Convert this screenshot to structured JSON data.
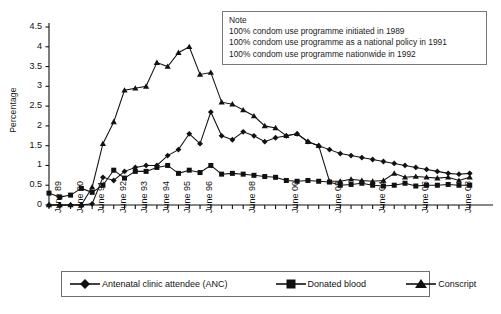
{
  "axis": {
    "y_title": "Percentage",
    "y_ticks": [
      "0",
      "0.5",
      "1",
      "1.5",
      "2",
      "2.5",
      "3",
      "3.5",
      "4",
      "4.5"
    ],
    "x_labels": [
      "June 89",
      "June 90",
      "June 91",
      "June 92",
      "June 93",
      "June 94",
      "June 95",
      "June 96",
      "June 98",
      "June 00",
      "June 02",
      "June 04",
      "June 06",
      "June 08"
    ]
  },
  "note": {
    "title": "Note",
    "line1": "100% condom use programme initiated in 1989",
    "line2": "100% condom use programme as a national policy in 1991",
    "line3": "100% condom use programme nationwide in 1992"
  },
  "legend": {
    "anc": "Antenatal clinic attendee (ANC)",
    "blood": "Donated blood",
    "conscript": "Conscript"
  },
  "chart_data": {
    "type": "line",
    "title": "",
    "xlabel": "",
    "ylabel": "Percentage",
    "ylim": [
      0,
      4.5
    ],
    "ytick_step": 0.5,
    "grid": false,
    "legend_position": "bottom",
    "x": [
      "June 89",
      "Dec 89",
      "June 90",
      "Dec 90",
      "June 91",
      "Dec 91",
      "June 92",
      "Dec 92",
      "June 93",
      "Dec 93",
      "June 94",
      "Dec 94",
      "June 95",
      "Dec 95",
      "June 96",
      "Dec 96",
      "June 97",
      "Dec 97",
      "June 98",
      "Dec 98",
      "June 99",
      "Dec 99",
      "June 00",
      "Dec 00",
      "June 01",
      "Dec 01",
      "June 02",
      "Dec 02",
      "June 03",
      "Dec 03",
      "June 04",
      "Dec 04",
      "June 05",
      "Dec 05",
      "June 06",
      "Dec 06",
      "June 07",
      "Dec 07",
      "June 08",
      "Dec 08"
    ],
    "series": [
      {
        "name": "Antenatal clinic attendee (ANC)",
        "marker": "diamond",
        "values": [
          0,
          0,
          0,
          0,
          0.03,
          0.7,
          0.62,
          0.85,
          0.95,
          1.0,
          1.0,
          1.25,
          1.4,
          1.8,
          1.55,
          2.35,
          1.75,
          1.65,
          1.85,
          1.75,
          1.6,
          1.7,
          1.75,
          1.8,
          1.6,
          1.5,
          1.4,
          1.3,
          1.25,
          1.2,
          1.15,
          1.1,
          1.05,
          1.0,
          0.95,
          0.9,
          0.85,
          0.8,
          0.78,
          0.8
        ]
      },
      {
        "name": "Donated blood",
        "marker": "square",
        "values": [
          0.3,
          0.2,
          0.25,
          0.42,
          0.32,
          0.5,
          0.88,
          0.68,
          0.85,
          0.85,
          0.95,
          1.0,
          0.8,
          0.88,
          0.82,
          1.0,
          0.78,
          0.8,
          0.78,
          0.75,
          0.72,
          0.7,
          0.62,
          0.6,
          0.62,
          0.6,
          0.58,
          0.5,
          0.52,
          0.55,
          0.5,
          0.48,
          0.5,
          0.55,
          0.48,
          0.5,
          0.5,
          0.52,
          0.5,
          0.5
        ]
      },
      {
        "name": "Conscript",
        "marker": "triangle",
        "values": [
          0,
          0,
          0,
          0,
          0.45,
          1.55,
          2.1,
          2.9,
          2.95,
          3.0,
          3.6,
          3.5,
          3.85,
          4.0,
          3.3,
          3.35,
          2.6,
          2.55,
          2.4,
          2.25,
          2.0,
          1.95,
          1.75,
          1.8,
          1.6,
          1.5,
          0.6,
          0.6,
          0.65,
          0.62,
          0.6,
          0.62,
          0.8,
          0.7,
          0.72,
          0.7,
          0.68,
          0.7,
          0.62,
          0.7
        ]
      }
    ]
  }
}
